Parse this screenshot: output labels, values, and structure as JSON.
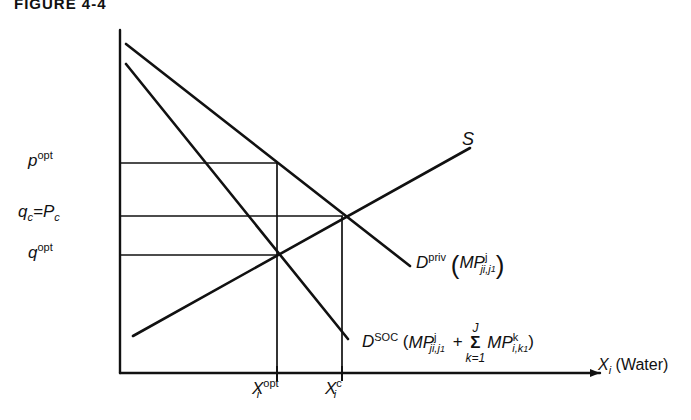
{
  "figure": {
    "title": "FIGURE 4-4",
    "line_color": "#111111",
    "background": "#ffffff"
  },
  "axes": {
    "x_axis_label_var": "X",
    "x_axis_label_sub": "i",
    "x_axis_label_paren": "(Water)",
    "y_axis_name": "price-axis",
    "x_axis_name": "quantity-axis"
  },
  "y_ticks": [
    {
      "id": "p-opt",
      "base": "p",
      "sup": "opt",
      "sub": "",
      "value_y": 163
    },
    {
      "id": "qc-pc",
      "text": "q",
      "sub1": "c",
      "eq": "=P",
      "sub2": "c",
      "value_y": 216
    },
    {
      "id": "q-opt",
      "base": "q",
      "sup": "opt",
      "sub": "",
      "value_y": 255
    }
  ],
  "x_ticks": [
    {
      "id": "x-opt",
      "base": "X",
      "sub": "i",
      "sup": "opt",
      "value_x": 277
    },
    {
      "id": "x-c",
      "base": "X",
      "sub": "i",
      "sup": "c",
      "value_x": 342
    }
  ],
  "curves": {
    "supply": {
      "label": "S",
      "name": "supply-curve",
      "points": "133,336 470,148"
    },
    "demand_private": {
      "label_main": "D",
      "label_sup": "priv",
      "arg_open": "(",
      "arg_base": "MP",
      "arg_sup": "j",
      "arg_sub": "ji,j",
      "arg_sub_small": "1",
      "arg_close": ")",
      "name": "demand-private-curve",
      "points": "126,44 410,266"
    },
    "demand_social": {
      "label_main": "D",
      "label_sup": "SOC",
      "arg_open": "(",
      "arg_base": "MP",
      "arg_sup": "j",
      "arg_sub": "ji,j",
      "arg_sub_small": "1",
      "plus": "+",
      "sum_top": "J",
      "sum_symbol": "Σ",
      "sum_bottom": "k=1",
      "term2_base": "MP",
      "term2_sup": "k",
      "term2_sub": "i,k",
      "term2_sub_small": "1",
      "arg_close": ")",
      "name": "demand-social-curve",
      "points": "126,64 348,339"
    }
  },
  "intersections": [
    {
      "name": "social-optimum-point",
      "x": 277,
      "y": 252
    },
    {
      "name": "competitive-equilibrium-point",
      "x": 342,
      "y": 216
    }
  ],
  "guide_lines": {
    "horizontal": [
      {
        "name": "p-opt-guide",
        "y": 163,
        "x_end": 277
      },
      {
        "name": "qc-guide",
        "y": 216,
        "x_end": 342
      },
      {
        "name": "q-opt-guide",
        "y": 255,
        "x_end": 277
      }
    ],
    "vertical": [
      {
        "name": "x-opt-guide",
        "x": 277,
        "y_top": 163
      },
      {
        "name": "x-c-guide",
        "x": 342,
        "y_top": 216
      }
    ]
  }
}
